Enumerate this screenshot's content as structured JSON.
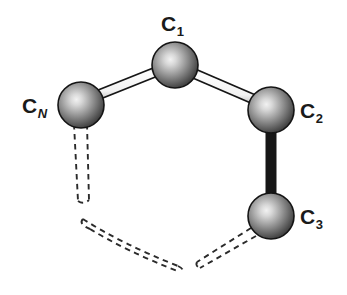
{
  "figure": {
    "kind": "molecular-structure-diagram",
    "background_color": "#ffffff",
    "width": 347,
    "height": 295
  },
  "style": {
    "atom_fill_light": "#ececec",
    "atom_fill_mid": "#8d8d8d",
    "atom_fill_dark": "#3a3a3a",
    "atom_outline": "#141414",
    "bond_fill": "#fdfdfd",
    "bond_outline": "#161616",
    "dashed_outline": "#2b2b2b",
    "label_color": "#1a1a1a"
  },
  "atoms": [
    {
      "id": "c1",
      "element": "C",
      "index": "1",
      "index_italic": false,
      "label_name": "atom-label-c1",
      "cx": 175,
      "cy": 65,
      "r": 23
    },
    {
      "id": "cn",
      "element": "C",
      "index": "N",
      "index_italic": true,
      "label_name": "atom-label-cn",
      "cx": 81,
      "cy": 105,
      "r": 23
    },
    {
      "id": "c2",
      "element": "C",
      "index": "2",
      "index_italic": false,
      "label_name": "atom-label-c2",
      "cx": 271,
      "cy": 110,
      "r": 23
    },
    {
      "id": "c3",
      "element": "C",
      "index": "3",
      "index_italic": false,
      "label_name": "atom-label-c3",
      "cx": 271,
      "cy": 216,
      "r": 23
    }
  ],
  "bonds": [
    {
      "id": "bond-cn-c1",
      "from": "cn",
      "to": "c1",
      "style": "solid",
      "label": "CN-C1 bond"
    },
    {
      "id": "bond-c1-c2",
      "from": "c1",
      "to": "c2",
      "style": "solid",
      "label": "C1-C2 bond"
    },
    {
      "id": "bond-c2-c3",
      "from": "c2",
      "to": "c3",
      "style": "solid",
      "label": "C2-C3 bond"
    },
    {
      "id": "bond-cn-open",
      "from": "cn",
      "to": "chain-continuation",
      "style": "dashed",
      "label": "CN open dashed bond"
    },
    {
      "id": "bond-c3-open",
      "from": "c3",
      "to": "chain-continuation",
      "style": "dashed",
      "label": "C3 open dashed bond"
    },
    {
      "id": "bond-chain-arc",
      "from": "chain-continuation",
      "to": "chain-continuation",
      "style": "dashed",
      "label": "omitted chain dashed arc"
    }
  ],
  "labels": {
    "c1": {
      "element": "C",
      "index": "1"
    },
    "cn": {
      "element": "C",
      "index": "N"
    },
    "c2": {
      "element": "C",
      "index": "2"
    },
    "c3": {
      "element": "C",
      "index": "3"
    }
  }
}
